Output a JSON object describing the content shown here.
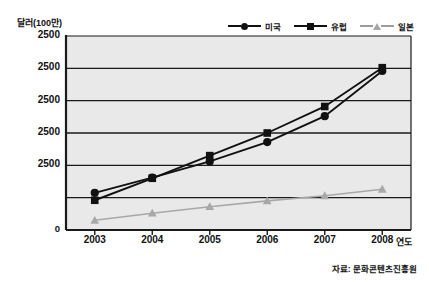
{
  "figure": {
    "title_cut": "",
    "source_note": "자료: 문화콘텐츠진흥원"
  },
  "axes": {
    "y_unit_label": "달러(100만)",
    "x_axis_title": "연도"
  },
  "legend": {
    "items": [
      {
        "label": "미국",
        "marker": "circle-marker",
        "color": "#111111"
      },
      {
        "label": "유럽",
        "marker": "square-marker",
        "color": "#111111"
      },
      {
        "label": "일본",
        "marker": "triangle-marker",
        "color": "#a8a8a8"
      }
    ]
  },
  "chart_data": {
    "type": "line",
    "title": "",
    "subtitle": "",
    "xlabel": "연도",
    "ylabel": "달러(100만)",
    "categories": [
      "2003",
      "2004",
      "2005",
      "2006",
      "2007",
      "2008"
    ],
    "x": [
      2003,
      2004,
      2005,
      2006,
      2007,
      2008
    ],
    "ytick_labels": [
      "2500",
      "2500",
      "2500",
      "2500",
      "2500",
      "0"
    ],
    "ylim": [
      0,
      6
    ],
    "grid": true,
    "legend_position": "top-right",
    "series": [
      {
        "name": "미국",
        "marker": "circle",
        "color": "#111111",
        "values": [
          1.15,
          1.62,
          2.12,
          2.72,
          3.52,
          4.92
        ]
      },
      {
        "name": "유럽",
        "marker": "square",
        "color": "#111111",
        "values": [
          0.92,
          1.6,
          2.3,
          3.0,
          3.82,
          5.02
        ]
      },
      {
        "name": "일본",
        "marker": "triangle",
        "color": "#a8a8a8",
        "values": [
          0.3,
          0.52,
          0.72,
          0.9,
          1.06,
          1.26
        ]
      }
    ]
  }
}
